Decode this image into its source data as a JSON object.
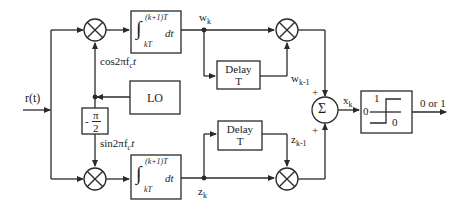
{
  "diagram": {
    "input": {
      "label": "r(t)"
    },
    "carriers": {
      "cos": "cos2πf",
      "cos_sub": "c",
      "cos_t": "t",
      "sin": "sin2πf",
      "sin_sub": "c",
      "sin_t": "t"
    },
    "oscillator": {
      "label": "LO"
    },
    "phase_shift": {
      "num": "π",
      "den": "2",
      "sign": "-"
    },
    "integrators": {
      "upper_limit": "(k+1)T",
      "lower_limit": "kT",
      "integrand": "dt",
      "symbol": "∫"
    },
    "branch_outputs": {
      "top": "w",
      "top_sub": "k",
      "bottom": "z",
      "bottom_sub": "k"
    },
    "delays": {
      "top": {
        "line1": "Delay",
        "line2": "T",
        "output": "w",
        "output_sub": "k-1"
      },
      "bottom": {
        "line1": "Delay",
        "line2": "T",
        "output": "z",
        "output_sub": "k-1"
      }
    },
    "summer": {
      "symbol": "Σ",
      "plus_top": "+",
      "plus_bottom": "+",
      "output": "x",
      "output_sub": "k"
    },
    "decision": {
      "high": "1",
      "low": "0",
      "threshold": "0",
      "output": "0 or 1"
    },
    "colors": {
      "line": "#2a2a2a",
      "background": "#ffffff"
    }
  }
}
